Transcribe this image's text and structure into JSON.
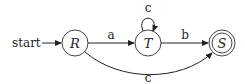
{
  "diagram": {
    "type": "finite-automaton",
    "start_label": "start",
    "states": [
      {
        "id": "R",
        "label": "R",
        "initial": true,
        "accepting": false
      },
      {
        "id": "T",
        "label": "T",
        "initial": false,
        "accepting": false
      },
      {
        "id": "S",
        "label": "S",
        "initial": false,
        "accepting": true
      }
    ],
    "transitions": [
      {
        "from": "R",
        "to": "T",
        "label": "a"
      },
      {
        "from": "T",
        "to": "T",
        "label": "c"
      },
      {
        "from": "T",
        "to": "S",
        "label": "b"
      },
      {
        "from": "R",
        "to": "S",
        "label": "c"
      }
    ]
  }
}
